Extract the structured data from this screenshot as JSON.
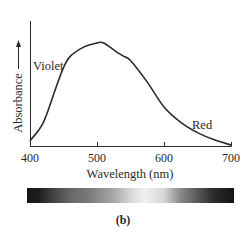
{
  "chart_data": {
    "type": "line",
    "title": "",
    "xlabel": "Wavelength (nm)",
    "ylabel": "Absorbance",
    "xlim": [
      400,
      700
    ],
    "ylim": [
      0,
      1.2
    ],
    "x_ticks": [
      400,
      500,
      600,
      700
    ],
    "y_ticks": [],
    "grid": false,
    "legend": "none",
    "series": [
      {
        "name": "Absorbance (relative)",
        "x": [
          400,
          420,
          440,
          450,
          460,
          480,
          500,
          510,
          530,
          540,
          550,
          575,
          600,
          625,
          650,
          675,
          700
        ],
        "values": [
          0.05,
          0.23,
          0.59,
          0.76,
          0.87,
          0.96,
          1.0,
          1.0,
          0.91,
          0.87,
          0.83,
          0.62,
          0.38,
          0.23,
          0.13,
          0.06,
          0.01
        ]
      }
    ],
    "annotations": [
      {
        "text": "Violet",
        "x": 430,
        "y": 0.83
      },
      {
        "text": "Red",
        "x": 660,
        "y": 0.22
      }
    ],
    "color_bar": {
      "description": "grayscale absorption spectrum band",
      "stops": [
        {
          "pos": 0.0,
          "color": "#141414"
        },
        {
          "pos": 0.14,
          "color": "#4a4a4a"
        },
        {
          "pos": 0.3,
          "color": "#7a7a7a"
        },
        {
          "pos": 0.42,
          "color": "#a8a8a8"
        },
        {
          "pos": 0.57,
          "color": "#f0f0f0"
        },
        {
          "pos": 0.74,
          "color": "#8a8a8a"
        },
        {
          "pos": 0.9,
          "color": "#2c2c2c"
        },
        {
          "pos": 1.0,
          "color": "#141414"
        }
      ]
    }
  },
  "labels": {
    "ylabel": "Absorbance",
    "xlabel": "Wavelength (nm)",
    "violet": "Violet",
    "red": "Red",
    "ticks": [
      "400",
      "500",
      "600",
      "700"
    ],
    "caption": "(b)"
  },
  "colors": {
    "line": "#2a2a2a",
    "axis": "#2a2a2a"
  }
}
